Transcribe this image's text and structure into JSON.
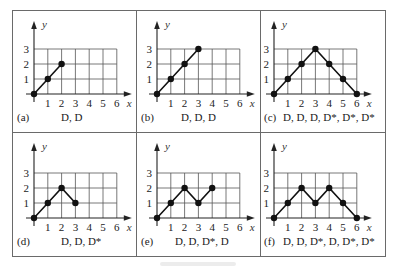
{
  "figure": {
    "axis_labels": {
      "x": "x",
      "y": "y"
    },
    "x_ticks": [
      "1",
      "2",
      "3",
      "4",
      "5",
      "6"
    ],
    "y_ticks": [
      "1",
      "2",
      "3"
    ],
    "panels": [
      {
        "id": "a",
        "label": "(a)",
        "sequence": "D, D",
        "points": [
          [
            0,
            0
          ],
          [
            1,
            1
          ],
          [
            2,
            2
          ]
        ]
      },
      {
        "id": "b",
        "label": "(b)",
        "sequence": "D, D, D",
        "points": [
          [
            0,
            0
          ],
          [
            1,
            1
          ],
          [
            2,
            2
          ],
          [
            3,
            3
          ]
        ]
      },
      {
        "id": "c",
        "label": "(c)",
        "sequence": "D, D, D, D*, D*, D*",
        "points": [
          [
            0,
            0
          ],
          [
            1,
            1
          ],
          [
            2,
            2
          ],
          [
            3,
            3
          ],
          [
            4,
            2
          ],
          [
            5,
            1
          ],
          [
            6,
            0
          ]
        ]
      },
      {
        "id": "d",
        "label": "(d)",
        "sequence": "D, D, D*",
        "points": [
          [
            0,
            0
          ],
          [
            1,
            1
          ],
          [
            2,
            2
          ],
          [
            3,
            1
          ]
        ]
      },
      {
        "id": "e",
        "label": "(e)",
        "sequence": "D, D, D*, D",
        "points": [
          [
            0,
            0
          ],
          [
            1,
            1
          ],
          [
            2,
            2
          ],
          [
            3,
            1
          ],
          [
            4,
            2
          ]
        ]
      },
      {
        "id": "f",
        "label": "(f)",
        "sequence": "D, D, D*, D, D*, D*",
        "points": [
          [
            0,
            0
          ],
          [
            1,
            1
          ],
          [
            2,
            2
          ],
          [
            3,
            1
          ],
          [
            4,
            2
          ],
          [
            5,
            1
          ],
          [
            6,
            0
          ]
        ]
      }
    ]
  },
  "chart_data": [
    {
      "type": "line",
      "title": "(a) D, D",
      "xlabel": "x",
      "ylabel": "y",
      "x": [
        0,
        1,
        2
      ],
      "values": [
        0,
        1,
        2
      ],
      "xlim": [
        0,
        6
      ],
      "ylim": [
        0,
        3
      ],
      "grid": true
    },
    {
      "type": "line",
      "title": "(b) D, D, D",
      "xlabel": "x",
      "ylabel": "y",
      "x": [
        0,
        1,
        2,
        3
      ],
      "values": [
        0,
        1,
        2,
        3
      ],
      "xlim": [
        0,
        6
      ],
      "ylim": [
        0,
        3
      ],
      "grid": true
    },
    {
      "type": "line",
      "title": "(c) D, D, D, D*, D*, D*",
      "xlabel": "x",
      "ylabel": "y",
      "x": [
        0,
        1,
        2,
        3,
        4,
        5,
        6
      ],
      "values": [
        0,
        1,
        2,
        3,
        2,
        1,
        0
      ],
      "xlim": [
        0,
        6
      ],
      "ylim": [
        0,
        3
      ],
      "grid": true
    },
    {
      "type": "line",
      "title": "(d) D, D, D*",
      "xlabel": "x",
      "ylabel": "y",
      "x": [
        0,
        1,
        2,
        3
      ],
      "values": [
        0,
        1,
        2,
        1
      ],
      "xlim": [
        0,
        6
      ],
      "ylim": [
        0,
        3
      ],
      "grid": true
    },
    {
      "type": "line",
      "title": "(e) D, D, D*, D",
      "xlabel": "x",
      "ylabel": "y",
      "x": [
        0,
        1,
        2,
        3,
        4
      ],
      "values": [
        0,
        1,
        2,
        1,
        2
      ],
      "xlim": [
        0,
        6
      ],
      "ylim": [
        0,
        3
      ],
      "grid": true
    },
    {
      "type": "line",
      "title": "(f) D, D, D*, D, D*, D*",
      "xlabel": "x",
      "ylabel": "y",
      "x": [
        0,
        1,
        2,
        3,
        4,
        5,
        6
      ],
      "values": [
        0,
        1,
        2,
        1,
        2,
        1,
        0
      ],
      "xlim": [
        0,
        6
      ],
      "ylim": [
        0,
        3
      ],
      "grid": true
    }
  ]
}
